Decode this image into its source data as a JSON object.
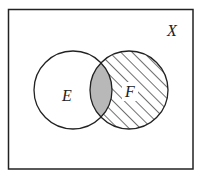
{
  "diagram": {
    "type": "venn",
    "universe": {
      "label": "X",
      "rect": {
        "x": 8.5,
        "y": 9.5,
        "width": 184.5,
        "height": 159.5
      },
      "label_pos": {
        "x": 172,
        "y": 36
      }
    },
    "sets": [
      {
        "id": "E",
        "label": "E",
        "cx": 73,
        "cy": 90,
        "r": 39,
        "fill": "none",
        "label_pos": {
          "x": 67,
          "y": 101
        }
      },
      {
        "id": "F",
        "label": "F",
        "cx": 129,
        "cy": 90,
        "r": 39,
        "fill": "hatched",
        "label_pos": {
          "x": 130,
          "y": 97
        }
      }
    ],
    "regions": {
      "E_only": "unshaded",
      "F_only": "hatched",
      "E_and_F": "gray"
    },
    "colors": {
      "stroke": "#222222",
      "intersection_fill": "#b8b8b8",
      "hatch": "#222222",
      "background": "#ffffff"
    }
  }
}
